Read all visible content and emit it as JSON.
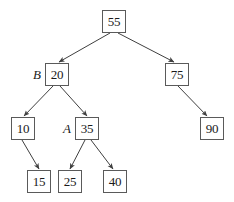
{
  "figure": {
    "kind": "binary-search-tree-diagram",
    "background_color": "#ffffff",
    "node_border_color": "#5a5a5a",
    "node_fill_color": "#ffffff",
    "text_color": "#1a1a1a",
    "edge_color": "#3f3f3f"
  },
  "nodes": [
    {
      "id": "n55",
      "value": "55",
      "label": "",
      "x": 102,
      "y": 10
    },
    {
      "id": "n20",
      "value": "20",
      "label": "B",
      "x": 45,
      "y": 63
    },
    {
      "id": "n75",
      "value": "75",
      "label": "",
      "x": 165,
      "y": 63
    },
    {
      "id": "n10",
      "value": "10",
      "label": "",
      "x": 11,
      "y": 117
    },
    {
      "id": "n35",
      "value": "35",
      "label": "A",
      "x": 75,
      "y": 117
    },
    {
      "id": "n90",
      "value": "90",
      "label": "",
      "x": 200,
      "y": 117
    },
    {
      "id": "n15",
      "value": "15",
      "label": "",
      "x": 27,
      "y": 170
    },
    {
      "id": "n25",
      "value": "25",
      "label": "",
      "x": 58,
      "y": 170
    },
    {
      "id": "n40",
      "value": "40",
      "label": "",
      "x": 103,
      "y": 170
    }
  ],
  "edges": [
    {
      "id": "e55-20",
      "from": "n55",
      "to": "n20",
      "x1": 110,
      "y1": 33,
      "x2": 59,
      "y2": 62
    },
    {
      "id": "e55-75",
      "from": "n55",
      "to": "n75",
      "x1": 118,
      "y1": 33,
      "x2": 174,
      "y2": 62
    },
    {
      "id": "e20-10",
      "from": "n20",
      "to": "n10",
      "x1": 53,
      "y1": 86,
      "x2": 24,
      "y2": 116
    },
    {
      "id": "e20-35",
      "from": "n20",
      "to": "n35",
      "x1": 60,
      "y1": 86,
      "x2": 87,
      "y2": 116
    },
    {
      "id": "e75-90",
      "from": "n75",
      "to": "n90",
      "x1": 178,
      "y1": 86,
      "x2": 207,
      "y2": 116
    },
    {
      "id": "e10-15",
      "from": "n10",
      "to": "n15",
      "x1": 22,
      "y1": 140,
      "x2": 39,
      "y2": 169
    },
    {
      "id": "e35-25",
      "from": "n35",
      "to": "n25",
      "x1": 85,
      "y1": 140,
      "x2": 70,
      "y2": 169
    },
    {
      "id": "e35-40",
      "from": "n35",
      "to": "n40",
      "x1": 91,
      "y1": 140,
      "x2": 113,
      "y2": 169
    }
  ]
}
